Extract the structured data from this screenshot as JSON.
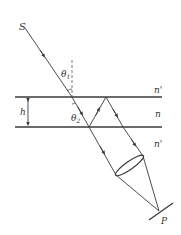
{
  "diagram": {
    "labels": {
      "source": "S",
      "theta1": "θ",
      "theta1_sub": "1",
      "theta2": "θ",
      "theta2_sub": "2",
      "thickness": "h",
      "n_top": "n'",
      "n_film": "n",
      "n_bottom": "n'",
      "point": "P"
    },
    "colors": {
      "line": "#3a3a3a",
      "background": "#ffffff"
    }
  }
}
